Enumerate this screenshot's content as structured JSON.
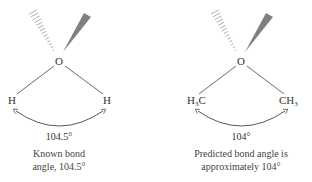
{
  "panels": [
    {
      "id": "water",
      "center_atom": "O",
      "left_group": {
        "main": "H",
        "sub": "",
        "tail": ""
      },
      "right_group": {
        "main": "H",
        "sub": "",
        "tail": ""
      },
      "angle_label": "104.5°",
      "caption": [
        "Known bond",
        "angle, 104.5°"
      ]
    },
    {
      "id": "dimethyl-ether",
      "center_atom": "O",
      "left_group": {
        "main": "H",
        "sub": "3",
        "tail": "C"
      },
      "right_group": {
        "main": "CH",
        "sub": "3",
        "tail": ""
      },
      "angle_label": "104°",
      "caption": [
        "Predicted bond angle is",
        "approximately 104°"
      ]
    }
  ],
  "colors": {
    "bond": "#444444",
    "wedge": "#808080",
    "text": "#333333"
  }
}
